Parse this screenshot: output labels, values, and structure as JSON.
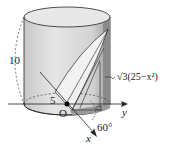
{
  "diagram": {
    "type": "cylinder-wedge",
    "labels": {
      "height": "10",
      "radius": "5",
      "origin": "O",
      "x_axis": "x",
      "y_axis": "y",
      "angle": "60°",
      "section_height": "√3(25−x²)"
    },
    "colors": {
      "cylinder_fill": "#d9d9d9",
      "wedge_fill": "#ececec",
      "right_strip": "#8a8a8a",
      "line": "#222222"
    }
  }
}
